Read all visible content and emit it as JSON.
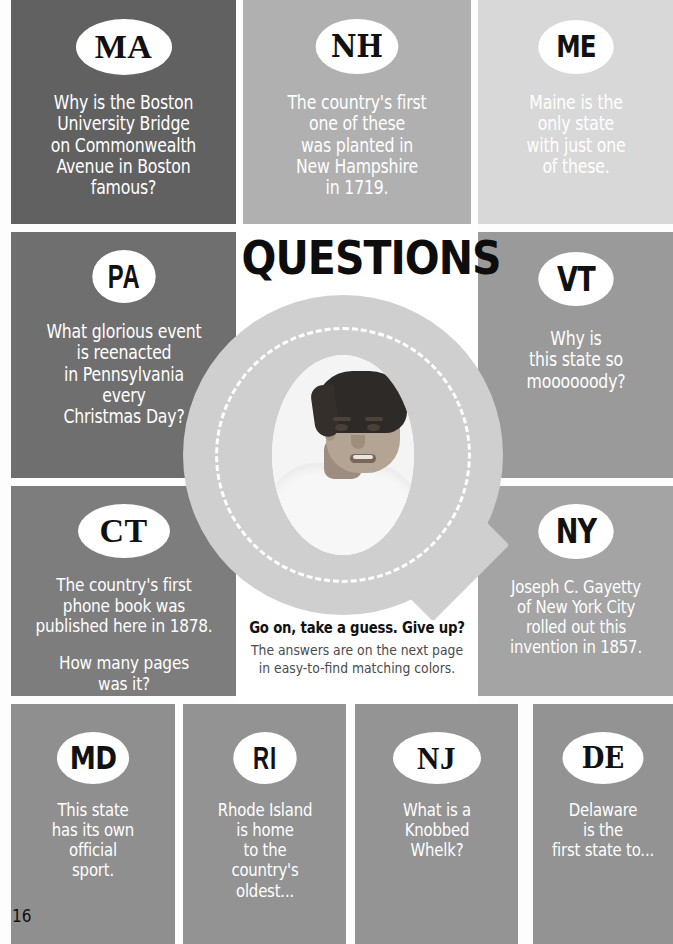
{
  "page": {
    "title": "QUESTIONS",
    "page_number": "16"
  },
  "caption": {
    "lead": "Go on, take a guess. Give up?",
    "line1": "The answers are on the next page",
    "line2": "in easy-to-find matching colors."
  },
  "center": {
    "letter": "Q",
    "photo_alt": "boy-portrait-photo"
  },
  "cards": [
    {
      "id": "ma",
      "badge": "MA",
      "color": "#616161",
      "lines": [
        "Why is the Boston",
        "University Bridge",
        "on Commonwealth",
        "Avenue in Boston",
        "famous?"
      ]
    },
    {
      "id": "nh",
      "badge": "NH",
      "color": "#b0b0b0",
      "lines": [
        "The country's first",
        "one of these",
        "was planted in",
        "New Hampshire",
        "in 1719."
      ]
    },
    {
      "id": "me",
      "badge": "ME",
      "color": "#d8d8d8",
      "lines": [
        "Maine is the",
        "only state",
        "with just one",
        "of these."
      ]
    },
    {
      "id": "pa",
      "badge": "PA",
      "color": "#6f6f6f",
      "lines": [
        "What glorious event",
        "is reenacted",
        "in Pennsylvania",
        "every",
        "Christmas Day?"
      ]
    },
    {
      "id": "vt",
      "badge": "VT",
      "color": "#9a9a9a",
      "lines": [
        "Why is",
        "this state so",
        "moooooody?"
      ]
    },
    {
      "id": "ct",
      "badge": "CT",
      "color": "#7d7d7d",
      "lines": [
        "The country's first",
        "phone book was",
        "published here in 1878.",
        "",
        "How many pages",
        "was it?"
      ]
    },
    {
      "id": "ny",
      "badge": "NY",
      "color": "#a4a4a4",
      "lines": [
        "Joseph C. Gayetty",
        "of New York City",
        "rolled out this",
        "invention in 1857."
      ]
    },
    {
      "id": "md",
      "badge": "MD",
      "color": "#8f8f8f",
      "lines": [
        "This state",
        "has its own",
        "official",
        "sport."
      ]
    },
    {
      "id": "ri",
      "badge": "RI",
      "color": "#939393",
      "lines": [
        "Rhode Island",
        "is home",
        "to the",
        "country's",
        "oldest..."
      ]
    },
    {
      "id": "nj",
      "badge": "NJ",
      "color": "#949494",
      "lines": [
        "What is a",
        "Knobbed",
        "Whelk?"
      ]
    },
    {
      "id": "de",
      "badge": "DE",
      "color": "#939393",
      "lines": [
        "Delaware",
        "is the",
        "first state to..."
      ]
    }
  ]
}
